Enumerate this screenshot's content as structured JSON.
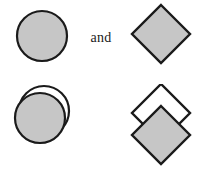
{
  "figure": {
    "background_color": "#ffffff",
    "width": 198,
    "height": 169
  },
  "style": {
    "fill_gray": "#c6c6c6",
    "stroke_black": "#1a1a1a",
    "fill_white": "#ffffff",
    "stroke_width": 2.2
  },
  "rows": [
    {
      "id": "row-top",
      "left": {
        "name": "single-circle",
        "shape": "circle",
        "count": 1,
        "fill": "#c6c6c6",
        "stroke": "#1a1a1a"
      },
      "conjunction": "and",
      "right": {
        "name": "single-diamond",
        "shape": "diamond",
        "count": 1,
        "fill": "#c6c6c6",
        "stroke": "#1a1a1a"
      }
    },
    {
      "id": "row-bottom",
      "left": {
        "name": "overlapping-circles",
        "shape": "circle",
        "count": 2,
        "fill": "#c6c6c6",
        "back_fill": "#ffffff",
        "stroke": "#1a1a1a",
        "offset_note": "back circle shifted up and right"
      },
      "conjunction": "and",
      "right": {
        "name": "overlapping-diamonds",
        "shape": "diamond",
        "count": 2,
        "fill": "#c6c6c6",
        "back_fill": "#ffffff",
        "stroke": "#1a1a1a",
        "offset_note": "back diamond shifted up"
      }
    }
  ],
  "labels": {
    "conjunction_top": "and",
    "conjunction_bottom": "and"
  }
}
